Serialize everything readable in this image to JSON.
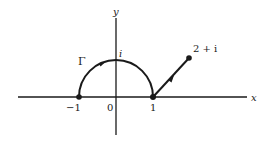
{
  "figure": {
    "axes": {
      "x_label": "x",
      "y_label": "y",
      "origin_label": "0"
    },
    "tick_labels": {
      "neg_one": "−1",
      "zero": "0",
      "one": "1"
    },
    "curve_label": "Γ",
    "point_labels": {
      "i": "i",
      "two_plus_i": "2 + i"
    },
    "points": [
      {
        "name": "-1",
        "re": -1,
        "im": 0,
        "marked": true
      },
      {
        "name": "i",
        "re": 0,
        "im": 1,
        "marked": false
      },
      {
        "name": "1",
        "re": 1,
        "im": 0,
        "marked": true
      },
      {
        "name": "2+i",
        "re": 2,
        "im": 1,
        "marked": true
      }
    ],
    "path_segments": [
      {
        "type": "arc",
        "from": "-1",
        "to": "1",
        "via": "i",
        "direction": "clockwise"
      },
      {
        "type": "segment",
        "from": "1",
        "to": "2+i"
      }
    ],
    "colors": {
      "ink": "#1a1a1a",
      "background": "#ffffff"
    }
  }
}
